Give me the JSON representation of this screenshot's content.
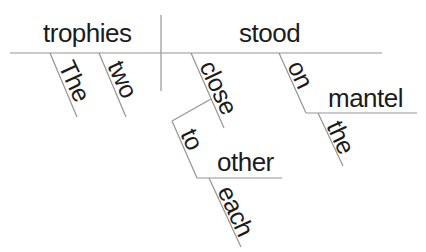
{
  "diagram": {
    "type": "reed-kellogg-sentence-diagram",
    "background": "#ffffff",
    "line_color": "#949494",
    "text_color": "#1c1c1c",
    "words": [
      {
        "name": "trophies",
        "text": "trophies",
        "role": "subject",
        "x": 43,
        "y": 20,
        "rotate": 0,
        "size": 26
      },
      {
        "name": "stood",
        "text": "stood",
        "role": "verb",
        "x": 239,
        "y": 20,
        "rotate": 0,
        "size": 26
      },
      {
        "name": "the-1",
        "text": "The",
        "role": "subject-modifier",
        "x": 77,
        "y": 57,
        "rotate": 65,
        "size": 25
      },
      {
        "name": "two",
        "text": "two",
        "role": "subject-modifier",
        "x": 126,
        "y": 57,
        "rotate": 65,
        "size": 25
      },
      {
        "name": "close",
        "text": "close",
        "role": "adverb",
        "x": 218,
        "y": 57,
        "rotate": 65,
        "size": 25
      },
      {
        "name": "to",
        "text": "to",
        "role": "preposition",
        "x": 199,
        "y": 125,
        "rotate": 65,
        "size": 25
      },
      {
        "name": "other",
        "text": "other",
        "role": "object-of-preposition",
        "x": 217,
        "y": 149,
        "rotate": 0,
        "size": 26
      },
      {
        "name": "each",
        "text": "each",
        "role": "modifier",
        "x": 236,
        "y": 182,
        "rotate": 65,
        "size": 25
      },
      {
        "name": "on",
        "text": "on",
        "role": "preposition",
        "x": 306,
        "y": 57,
        "rotate": 65,
        "size": 25
      },
      {
        "name": "mantel",
        "text": "mantel",
        "role": "object-of-preposition",
        "x": 328,
        "y": 85,
        "rotate": 0,
        "size": 26
      },
      {
        "name": "the-2",
        "text": "the",
        "role": "modifier",
        "x": 345,
        "y": 117,
        "rotate": 65,
        "size": 25
      }
    ],
    "lines": [
      {
        "name": "main-baseline",
        "x1": 10,
        "y1": 53,
        "x2": 382,
        "y2": 53
      },
      {
        "name": "subject-verb-divider",
        "x1": 161,
        "y1": 15,
        "x2": 161,
        "y2": 91
      },
      {
        "name": "the-1-slant",
        "x1": 50,
        "y1": 53,
        "x2": 77,
        "y2": 117
      },
      {
        "name": "two-slant",
        "x1": 99,
        "y1": 53,
        "x2": 126,
        "y2": 117
      },
      {
        "name": "close-slant",
        "x1": 191,
        "y1": 53,
        "x2": 224,
        "y2": 128
      },
      {
        "name": "close-to-bracket",
        "x1": 211,
        "y1": 99,
        "x2": 172,
        "y2": 121
      },
      {
        "name": "to-slant",
        "x1": 172,
        "y1": 121,
        "x2": 197,
        "y2": 178
      },
      {
        "name": "other-baseline",
        "x1": 197,
        "y1": 178,
        "x2": 282,
        "y2": 178
      },
      {
        "name": "each-slant",
        "x1": 209,
        "y1": 178,
        "x2": 241,
        "y2": 247
      },
      {
        "name": "on-slant",
        "x1": 279,
        "y1": 53,
        "x2": 306,
        "y2": 113
      },
      {
        "name": "mantel-baseline",
        "x1": 306,
        "y1": 113,
        "x2": 417,
        "y2": 113
      },
      {
        "name": "the-2-slant",
        "x1": 318,
        "y1": 113,
        "x2": 343,
        "y2": 166
      }
    ]
  }
}
